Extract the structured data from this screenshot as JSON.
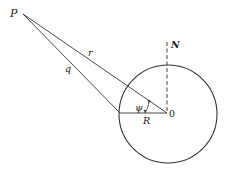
{
  "diagram": {
    "labels": {
      "P": "P",
      "r": "r",
      "q": "q",
      "N": "N",
      "psi": "ψ",
      "R": "R",
      "O": "0"
    },
    "colors": {
      "stroke": "#333333",
      "background": "#ffffff"
    }
  }
}
